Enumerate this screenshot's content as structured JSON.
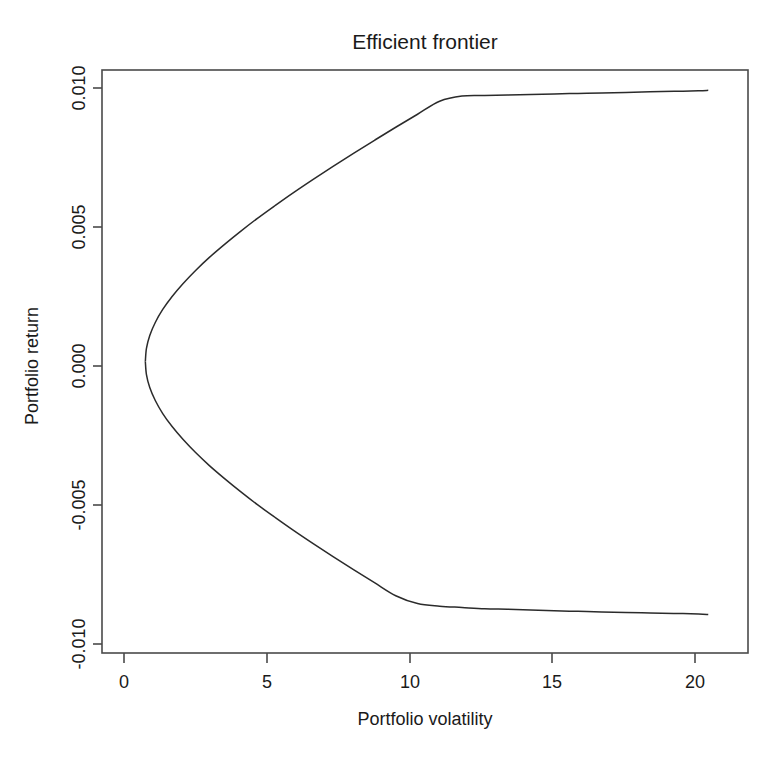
{
  "figure": {
    "title": "Efficient frontier",
    "background_color": "#ffffff",
    "foreground_color": "#1a1a1a"
  },
  "axes": {
    "x_label": "Portfolio volatility",
    "y_label": "Portfolio return",
    "x_ticks": [
      "0",
      "5",
      "10",
      "15",
      "20"
    ],
    "y_ticks": [
      "0.010",
      "0.005",
      "0.000",
      "-0.005",
      "-0.010"
    ]
  },
  "chart_data": {
    "type": "line",
    "title": "Efficient frontier",
    "xlabel": "Portfolio volatility",
    "ylabel": "Portfolio return",
    "xlim": [
      -0.75,
      22.65
    ],
    "ylim": [
      -0.0112,
      0.0112
    ],
    "xticks": [
      0,
      5,
      10,
      15,
      20
    ],
    "yticks": [
      0.01,
      0.005,
      0.0,
      -0.005,
      -0.01
    ],
    "grid": false,
    "legend": "none",
    "series": [
      {
        "name": "Minimum variance frontier",
        "x": [
          0.82,
          0.86,
          0.98,
          1.18,
          1.45,
          1.79,
          2.19,
          2.64,
          3.14,
          3.69,
          4.27,
          4.88,
          5.53,
          6.2,
          6.9,
          7.62,
          8.36,
          9.12,
          9.89,
          10.68,
          11.48,
          12.29,
          13.11,
          13.94,
          14.78,
          15.63,
          16.49,
          17.35,
          18.22,
          19.1,
          19.98,
          20.86,
          21.21
        ],
        "y": [
          0.0,
          0.0005,
          0.001,
          0.0015,
          0.002,
          0.0025,
          0.003,
          0.0035,
          0.004,
          0.0045,
          0.005,
          0.0055,
          0.006,
          0.0065,
          0.007,
          0.0075,
          0.008,
          0.0085,
          0.009,
          0.0095,
          0.01,
          0.0102,
          0.01022,
          0.01024,
          0.01026,
          0.01028,
          0.0103,
          0.01032,
          0.01034,
          0.01036,
          0.01038,
          0.0104,
          0.01042
        ]
      },
      {
        "name": "Inefficient lower branch",
        "x": [
          0.82,
          0.86,
          0.98,
          1.18,
          1.45,
          1.79,
          2.19,
          2.64,
          3.14,
          3.69,
          4.27,
          4.88,
          5.53,
          6.2,
          6.9,
          7.62,
          8.36,
          9.12,
          9.89,
          10.68,
          11.48,
          12.29,
          13.11,
          13.94,
          14.78,
          15.63,
          16.49,
          17.35,
          18.22,
          19.1,
          19.98,
          20.86,
          21.21
        ],
        "y": [
          0.0,
          -0.0005,
          -0.001,
          -0.0015,
          -0.002,
          -0.0025,
          -0.003,
          -0.0035,
          -0.004,
          -0.0045,
          -0.005,
          -0.0055,
          -0.006,
          -0.0065,
          -0.007,
          -0.0075,
          -0.008,
          -0.0085,
          -0.009,
          -0.0093,
          -0.0094,
          -0.00945,
          -0.0095,
          -0.00952,
          -0.00955,
          -0.00958,
          -0.0096,
          -0.00962,
          -0.00964,
          -0.00966,
          -0.00968,
          -0.0097,
          -0.00972
        ]
      }
    ],
    "vertex": {
      "x": 0.82,
      "y": 0.0
    }
  }
}
